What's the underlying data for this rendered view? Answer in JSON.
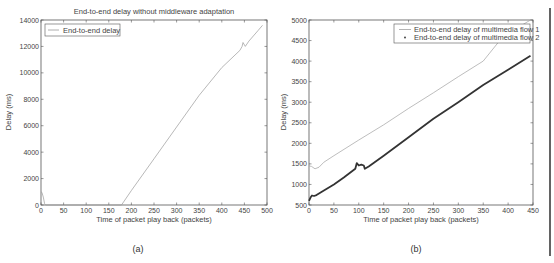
{
  "chart_data": [
    {
      "id": "a",
      "type": "line",
      "title": "End-to-end delay without middleware adaptation",
      "xlabel": "Time of packet play back (packets)",
      "ylabel": "Delay (ms)",
      "caption": "(a)",
      "xlim": [
        0,
        500
      ],
      "ylim": [
        0,
        14000
      ],
      "xticks": [
        0,
        50,
        100,
        150,
        200,
        250,
        300,
        350,
        400,
        450,
        500
      ],
      "yticks": [
        0,
        2000,
        4000,
        6000,
        8000,
        10000,
        12000,
        14000
      ],
      "grid": false,
      "legend_position": "upper left",
      "series": [
        {
          "name": "End-to-end delay",
          "color": "#9a9a9a",
          "style": "line",
          "x": [
            0,
            2,
            5,
            8,
            10,
            50,
            100,
            150,
            178,
            200,
            250,
            300,
            350,
            400,
            440,
            445,
            447,
            452,
            460,
            480,
            490
          ],
          "y": [
            1000,
            950,
            600,
            100,
            0,
            0,
            0,
            0,
            0,
            1100,
            3500,
            5900,
            8300,
            10400,
            11700,
            12000,
            12300,
            12000,
            12400,
            13200,
            13600
          ]
        }
      ]
    },
    {
      "id": "b",
      "type": "line",
      "title": "",
      "xlabel": "Time of packet play back (packets)",
      "ylabel": "Delay (ms)",
      "caption": "(b)",
      "xlim": [
        0,
        450
      ],
      "ylim": [
        500,
        5000
      ],
      "xticks": [
        0,
        50,
        100,
        150,
        200,
        250,
        300,
        350,
        400,
        450
      ],
      "yticks": [
        500,
        1000,
        1500,
        2000,
        2500,
        3000,
        3500,
        4000,
        4500,
        5000
      ],
      "grid": false,
      "legend_position": "upper right",
      "series": [
        {
          "name": "End-to-end delay of multimedia flow 1",
          "color": "#a0a0a0",
          "style": "line",
          "x": [
            0,
            5,
            12,
            20,
            30,
            50,
            100,
            150,
            200,
            250,
            300,
            350,
            390,
            445
          ],
          "y": [
            1450,
            1440,
            1380,
            1420,
            1540,
            1700,
            2080,
            2450,
            2850,
            3230,
            3620,
            4000,
            4600,
            5000
          ]
        },
        {
          "name": "End-to-end delay of multimedia flow 2",
          "color": "#333333",
          "style": "dots",
          "x": [
            0,
            3,
            6,
            10,
            15,
            30,
            50,
            70,
            93,
            96,
            100,
            105,
            110,
            112,
            120,
            150,
            200,
            250,
            300,
            350,
            400,
            445
          ],
          "y": [
            600,
            680,
            730,
            720,
            740,
            850,
            1000,
            1170,
            1380,
            1520,
            1460,
            1480,
            1460,
            1380,
            1440,
            1700,
            2150,
            2600,
            3000,
            3420,
            3790,
            4130
          ]
        }
      ]
    }
  ]
}
